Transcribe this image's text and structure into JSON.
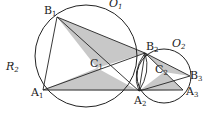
{
  "figure": {
    "type": "geometry-diagram",
    "colors": {
      "stroke": "#222222",
      "shade": "#c8c8c8",
      "background": "#ffffff"
    }
  },
  "labels": {
    "O1": {
      "base": "O",
      "sub": "1"
    },
    "O2": {
      "base": "O",
      "sub": "2"
    },
    "R2": {
      "base": "R",
      "sub": "2"
    },
    "B1": {
      "base": "B",
      "sub": "1"
    },
    "B2": {
      "base": "B",
      "sub": "2"
    },
    "B3": {
      "base": "B",
      "sub": "3"
    },
    "A1": {
      "base": "A",
      "sub": "1"
    },
    "A2": {
      "base": "A",
      "sub": "2"
    },
    "A3": {
      "base": "A",
      "sub": "3"
    },
    "C1": {
      "base": "C",
      "sub": "1"
    },
    "C2": {
      "base": "C",
      "sub": "2"
    }
  },
  "points": {
    "A1": [
      43,
      90
    ],
    "B1": [
      57,
      17
    ],
    "C1": [
      97,
      68
    ],
    "A2": [
      139,
      91
    ],
    "B2": [
      145,
      53
    ],
    "C2": [
      164,
      72
    ],
    "A3": [
      183,
      90
    ],
    "B3": [
      190,
      76
    ]
  }
}
